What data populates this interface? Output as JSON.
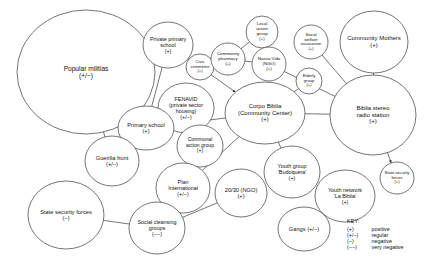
{
  "diagram": {
    "legend": {
      "title": "KEY:",
      "entries": [
        {
          "symbol": "(+)",
          "meaning": "positive"
        },
        {
          "symbol": "(+/−)",
          "meaning": "regular"
        },
        {
          "symbol": "(−)",
          "meaning": "negative"
        },
        {
          "symbol": "(−−)",
          "meaning": "very negative"
        }
      ]
    },
    "nodes": [
      {
        "id": "popular-militias",
        "name": "Popular militias",
        "valence": "(+/−)",
        "cx": 86,
        "cy": 72,
        "rx": 69,
        "ry": 62,
        "font": 6.6,
        "label_dy": 0
      },
      {
        "id": "private-primary-school",
        "name": "Private primary\nschool",
        "valence": "(+)",
        "cx": 168,
        "cy": 45,
        "rx": 25,
        "ry": 23,
        "font": 5.4,
        "label_dy": 0
      },
      {
        "id": "civic-committee",
        "name": "Civic\ncommittee",
        "valence": "(+)",
        "cx": 200,
        "cy": 67,
        "rx": 14,
        "ry": 13,
        "font": 4.1,
        "label_dy": 0
      },
      {
        "id": "community-pharmacy",
        "name": "Community\npharmacy",
        "valence": "(+)",
        "cx": 228,
        "cy": 59,
        "rx": 17,
        "ry": 16,
        "font": 4.4,
        "label_dy": 0
      },
      {
        "id": "local-action-group",
        "name": "Local\naction\ngroup",
        "valence": "(+)",
        "cx": 262,
        "cy": 32,
        "rx": 16,
        "ry": 16,
        "font": 4.4,
        "label_dy": 0
      },
      {
        "id": "nueva-vida-ngo",
        "name": "Nueva Vida\n(NGO)",
        "valence": "(+)",
        "cx": 269,
        "cy": 64,
        "rx": 17,
        "ry": 17,
        "font": 4.4,
        "label_dy": 0
      },
      {
        "id": "social-welfare-assoc",
        "name": "Social\nwelfare\nassociation",
        "valence": "(+)",
        "cx": 311,
        "cy": 42,
        "rx": 17,
        "ry": 17,
        "font": 4.1,
        "label_dy": 0
      },
      {
        "id": "elderly-group",
        "name": "Elderly\ngroup",
        "valence": "(+)",
        "cx": 309,
        "cy": 81,
        "rx": 13,
        "ry": 13,
        "font": 4.1,
        "label_dy": 0
      },
      {
        "id": "community-mothers",
        "name": "Community Mothers",
        "valence": "(+)",
        "cx": 374,
        "cy": 42,
        "rx": 34,
        "ry": 31,
        "font": 6.0,
        "label_dy": 0
      },
      {
        "id": "biblia-stereo-radio",
        "name": "Biblia stereo\nradio station",
        "valence": "(+)",
        "cx": 373,
        "cy": 115,
        "rx": 43,
        "ry": 40,
        "font": 6.0,
        "label_dy": 0
      },
      {
        "id": "fenavid",
        "name": "FENAVID\n(private sector\nhousing)",
        "valence": "(+/−)",
        "cx": 186,
        "cy": 108,
        "rx": 28,
        "ry": 25,
        "font": 5.4,
        "label_dy": 0
      },
      {
        "id": "corpo-biblia",
        "name": "Corpo Biblia\n(Community Center)",
        "valence": "(+)",
        "cx": 265,
        "cy": 113,
        "rx": 40,
        "ry": 31,
        "font": 6.0,
        "label_dy": 0
      },
      {
        "id": "primary-school",
        "name": "Primary school",
        "valence": "(+)",
        "cx": 146,
        "cy": 128,
        "rx": 28,
        "ry": 22,
        "font": 5.7,
        "label_dy": 0
      },
      {
        "id": "communal-action-group",
        "name": "Communal\naction group",
        "valence": "(+)",
        "cx": 200,
        "cy": 146,
        "rx": 23,
        "ry": 21,
        "font": 5.1,
        "label_dy": 0
      },
      {
        "id": "guerilla-front",
        "name": "Guerilla front",
        "valence": "(+/−)",
        "cx": 112,
        "cy": 161,
        "rx": 27,
        "ry": 25,
        "font": 5.7,
        "label_dy": 0
      },
      {
        "id": "plan-international",
        "name": "Plan\nInternational",
        "valence": "(+/−)",
        "cx": 183,
        "cy": 188,
        "rx": 27,
        "ry": 25,
        "font": 5.4,
        "label_dy": 0
      },
      {
        "id": "twenty-thirty-ngo",
        "name": "20/30 (NGO)",
        "valence": "(+)",
        "cx": 241,
        "cy": 193,
        "rx": 26,
        "ry": 24,
        "font": 5.7,
        "label_dy": 0
      },
      {
        "id": "youth-group-budoquera",
        "name": "Youth group\n'Budoquera'",
        "valence": "(+)",
        "cx": 292,
        "cy": 172,
        "rx": 28,
        "ry": 26,
        "font": 5.4,
        "label_dy": 0
      },
      {
        "id": "youth-network-la-biblia",
        "name": "Youth network\n'La Biblia'",
        "valence": "(+)",
        "cx": 345,
        "cy": 196,
        "rx": 30,
        "ry": 26,
        "font": 5.4,
        "label_dy": 0
      },
      {
        "id": "state-security-forces-pos",
        "name": "State security\nforces",
        "valence": "(+)",
        "cx": 397,
        "cy": 178,
        "rx": 17,
        "ry": 16,
        "font": 4.1,
        "label_dy": 0
      },
      {
        "id": "state-security-forces-neg",
        "name": "State security forces",
        "valence": "(−)",
        "cx": 66,
        "cy": 215,
        "rx": 38,
        "ry": 34,
        "font": 5.7,
        "label_dy": 0
      },
      {
        "id": "social-cleansing-groups",
        "name": "Social cleansing\ngroups",
        "valence": "(−−)",
        "cx": 157,
        "cy": 228,
        "rx": 28,
        "ry": 26,
        "font": 5.4,
        "label_dy": 0
      },
      {
        "id": "gangs",
        "name": "Gangs (+/−)",
        "valence": "",
        "cx": 304,
        "cy": 229,
        "rx": 26,
        "ry": 22,
        "font": 5.7,
        "label_dy": 0
      }
    ],
    "edges": [
      {
        "from": "popular-militias",
        "to": "guerilla-front",
        "arrow": "none"
      },
      {
        "from": "popular-militias",
        "to": "primary-school",
        "arrow": "none"
      },
      {
        "from": "private-primary-school",
        "to": "primary-school",
        "arrow": "none"
      },
      {
        "from": "civic-committee",
        "to": "private-primary-school",
        "arrow": "target"
      },
      {
        "from": "community-pharmacy",
        "to": "civic-committee",
        "arrow": "none"
      },
      {
        "from": "community-pharmacy",
        "to": "local-action-group",
        "arrow": "none"
      },
      {
        "from": "community-pharmacy",
        "to": "nueva-vida-ngo",
        "arrow": "none"
      },
      {
        "from": "nueva-vida-ngo",
        "to": "biblia-stereo-radio",
        "arrow": "none"
      },
      {
        "from": "social-welfare-assoc",
        "to": "biblia-stereo-radio",
        "arrow": "none"
      },
      {
        "from": "elderly-group",
        "to": "corpo-biblia",
        "arrow": "none"
      },
      {
        "from": "community-mothers",
        "to": "biblia-stereo-radio",
        "arrow": "none"
      },
      {
        "from": "civic-committee",
        "to": "corpo-biblia",
        "arrow": "target"
      },
      {
        "from": "fenavid",
        "to": "primary-school",
        "arrow": "target"
      },
      {
        "from": "corpo-biblia",
        "to": "primary-school",
        "arrow": "target"
      },
      {
        "from": "corpo-biblia",
        "to": "biblia-stereo-radio",
        "arrow": "none"
      },
      {
        "from": "corpo-biblia",
        "to": "youth-group-budoquera",
        "arrow": "none"
      },
      {
        "from": "corpo-biblia",
        "to": "plan-international",
        "arrow": "none"
      },
      {
        "from": "biblia-stereo-radio",
        "to": "state-security-forces-pos",
        "arrow": "target"
      },
      {
        "from": "state-security-forces-neg",
        "to": "social-cleansing-groups",
        "arrow": "none"
      },
      {
        "from": "social-cleansing-groups",
        "to": "twenty-thirty-ngo",
        "arrow": "none"
      }
    ],
    "colors": {
      "background": "#ffffff",
      "node_stroke": "#3a3a3a",
      "edge_stroke": "#3a3a3a",
      "text": "#111111"
    }
  }
}
